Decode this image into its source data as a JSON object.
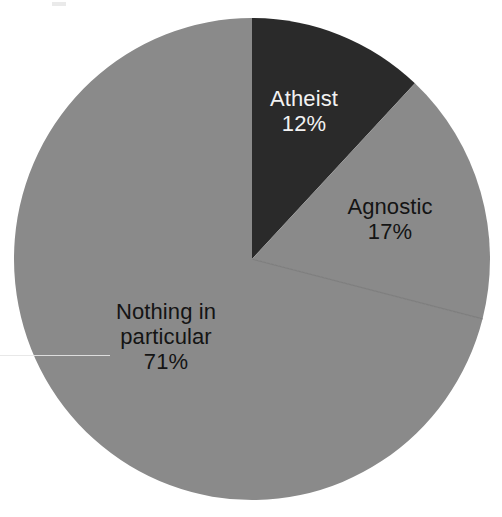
{
  "chart_data": {
    "type": "pie",
    "title": "",
    "subtitle": "",
    "xlabel": "",
    "ylabel": "",
    "grid": false,
    "legend_position": "none",
    "label_format": "name + percent",
    "start_angle_deg": 0,
    "direction": "clockwise",
    "categories": [
      "Atheist",
      "Agnostic",
      "Nothing in particular"
    ],
    "values": [
      12,
      17,
      71
    ],
    "unit": "%",
    "slices": [
      {
        "name": "Atheist",
        "value": 12,
        "percent_label": "12%",
        "color": "#2a2a2a",
        "label_color": "#f2f2f2",
        "label_lines": [
          "Atheist",
          "12%"
        ]
      },
      {
        "name": "Agnostic",
        "value": 17,
        "percent_label": "17%",
        "color": "#8a8a8a",
        "label_color": "#141414",
        "label_lines": [
          "Agnostic",
          "17%"
        ]
      },
      {
        "name": "Nothing in particular",
        "value": 71,
        "percent_label": "71%",
        "color": "#8a8a8a",
        "label_color": "#141414",
        "label_lines": [
          "Nothing in",
          "particular",
          "71%"
        ]
      }
    ]
  },
  "labels": {
    "atheist": "Atheist\n12%",
    "agnostic": "Agnostic\n17%",
    "nothing": "Nothing in\nparticular\n71%"
  },
  "colors": {
    "background": "#ffffff",
    "slice_dark": "#2a2a2a",
    "slice_gray": "#8a8a8a",
    "divider": "#7e7e7e",
    "label_on_dark": "#f2f2f2",
    "label_on_gray": "#141414"
  }
}
